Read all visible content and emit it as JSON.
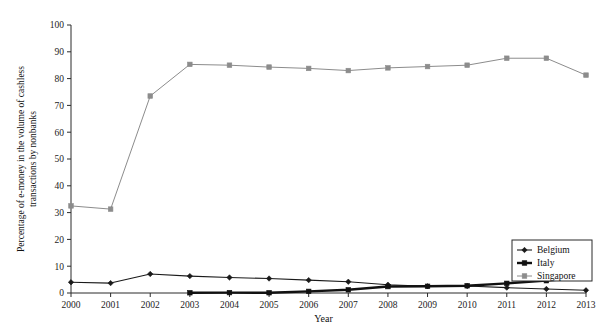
{
  "chart_data": {
    "type": "line",
    "title": "",
    "xlabel": "Year",
    "ylabel": "Percentage of e-money in the volume of cashless transactions by nonbanks",
    "ylabel_lines": [
      "Percentage of e-money in the volume of cashless",
      "transactions by nonbanks"
    ],
    "categories": [
      "2000",
      "2001",
      "2002",
      "2003",
      "2004",
      "2005",
      "2006",
      "2007",
      "2008",
      "2009",
      "2010",
      "2011",
      "2012",
      "2013"
    ],
    "x": [
      2000,
      2001,
      2002,
      2003,
      2004,
      2005,
      2006,
      2007,
      2008,
      2009,
      2010,
      2011,
      2012,
      2013
    ],
    "xlim": [
      2000,
      2013
    ],
    "ylim": [
      0,
      100
    ],
    "yticks": [
      0,
      10,
      20,
      30,
      40,
      50,
      60,
      70,
      80,
      90,
      100
    ],
    "ytick_labels": [
      "0",
      "10",
      "20",
      "30",
      "40",
      "50",
      "60",
      "70",
      "80",
      "90",
      "100"
    ],
    "grid": false,
    "legend_position": "lower-right",
    "series": [
      {
        "name": "Belgium",
        "color": "#1a1a1a",
        "marker": "diamond",
        "line_width": 1.1,
        "values": [
          4.0,
          3.7,
          7.1,
          6.3,
          5.8,
          5.4,
          4.8,
          4.2,
          3.1,
          2.5,
          2.6,
          2.0,
          1.5,
          1.0
        ]
      },
      {
        "name": "Italy",
        "color": "#111111",
        "marker": "square",
        "line_width": 2.4,
        "values": [
          null,
          null,
          null,
          0.1,
          0.15,
          0.1,
          0.6,
          1.2,
          2.4,
          2.5,
          2.7,
          3.6,
          4.6,
          5.8
        ]
      },
      {
        "name": "Singapore",
        "color": "#8c8c8c",
        "marker": "square",
        "line_width": 1.0,
        "values": [
          32.5,
          31.3,
          73.5,
          85.3,
          85.0,
          84.3,
          83.8,
          83.0,
          84.0,
          84.5,
          85.0,
          87.6,
          87.6,
          81.3
        ]
      }
    ]
  },
  "legend": {
    "entries": [
      {
        "label": "Belgium"
      },
      {
        "label": "Italy"
      },
      {
        "label": "Singapore"
      }
    ]
  }
}
